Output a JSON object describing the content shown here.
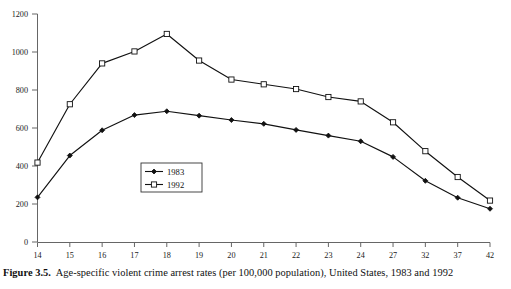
{
  "figure": {
    "number_label": "Figure 3.5.",
    "caption_text": "Age-specific violent crime arrest rates (per 100,000 population), United States, 1983 and 1992"
  },
  "colors": {
    "axis": "#555555",
    "line": "#111111",
    "marker_fill_1983": "#111111",
    "marker_fill_1992": "#ffffff",
    "background": "#ffffff",
    "text": "#101010"
  },
  "legend": {
    "position": "inside-center-lower",
    "entries": [
      {
        "label": "1983",
        "marker": "filled-diamond"
      },
      {
        "label": "1992",
        "marker": "open-square"
      }
    ]
  },
  "chart_data": {
    "type": "line",
    "title": "",
    "subtitle": "",
    "xlabel": "",
    "ylabel": "",
    "grid": false,
    "legend_position": "inside-center-lower",
    "categories": [
      "14",
      "15",
      "16",
      "17",
      "18",
      "19",
      "20",
      "21",
      "22",
      "23",
      "24",
      "27",
      "32",
      "37",
      "42"
    ],
    "x_tick_labels": [
      "14",
      "15",
      "16",
      "17",
      "18",
      "19",
      "20",
      "21",
      "22",
      "23",
      "24",
      "27",
      "32",
      "37",
      "42"
    ],
    "y_tick_labels": [
      "0",
      "200",
      "400",
      "600",
      "800",
      "1000",
      "1200"
    ],
    "y_ticks": [
      0,
      200,
      400,
      600,
      800,
      1000,
      1200
    ],
    "ylim": [
      0,
      1200
    ],
    "series": [
      {
        "name": "1983",
        "marker": "filled-diamond",
        "values": [
          235,
          455,
          588,
          668,
          688,
          665,
          642,
          622,
          590,
          560,
          530,
          448,
          322,
          233,
          175
        ]
      },
      {
        "name": "1992",
        "marker": "open-square",
        "values": [
          418,
          725,
          940,
          1003,
          1095,
          955,
          855,
          830,
          805,
          763,
          740,
          630,
          478,
          342,
          218
        ]
      }
    ]
  }
}
